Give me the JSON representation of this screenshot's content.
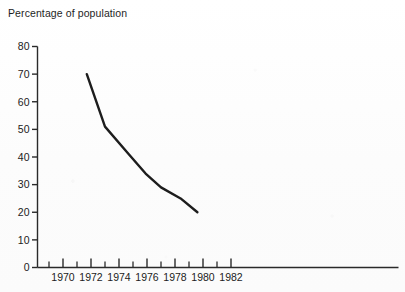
{
  "figure": {
    "title_partial": "",
    "axis_label": "Percentage of population",
    "line_color": "#1d1d1d",
    "axis_color": "#2a2a2a",
    "background_color": "#fdfdfd"
  },
  "chart_data": {
    "type": "line",
    "title": "",
    "xlabel": "",
    "ylabel": "Percentage of population",
    "xlim": [
      1969,
      1982
    ],
    "ylim": [
      0,
      80
    ],
    "grid": false,
    "legend": null,
    "x_ticks_major": [
      1970,
      1972,
      1974,
      1976,
      1978,
      1980,
      1982
    ],
    "x_tick_labels": [
      "1970",
      "1972",
      "1974",
      "1976",
      "1978",
      "1980",
      "1982"
    ],
    "x_ticks_minor": [
      1969,
      1971,
      1973,
      1975,
      1977,
      1979,
      1981
    ],
    "y_ticks": [
      0,
      10,
      20,
      30,
      40,
      50,
      60,
      70,
      80
    ],
    "y_tick_labels": [
      "0",
      "10",
      "20",
      "30",
      "40",
      "50",
      "60",
      "70",
      "80"
    ],
    "series": [
      {
        "name": "Percentage of population",
        "x": [
          1971.7,
          1973.0,
          1974.7,
          1975.9,
          1977.0,
          1978.4,
          1979.6
        ],
        "values": [
          70,
          51,
          41,
          34,
          29,
          25,
          20
        ]
      }
    ]
  }
}
